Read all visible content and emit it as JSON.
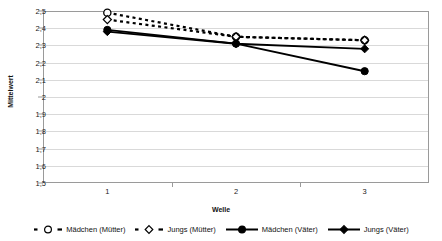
{
  "chart_data": {
    "type": "line",
    "title": "",
    "xlabel": "Welle",
    "ylabel": "Mittelwert",
    "categories": [
      "1",
      "2",
      "3"
    ],
    "ylim": [
      1.5,
      2.5
    ],
    "yticks": [
      "1,5",
      "1,6",
      "1,7",
      "1,8",
      "1,9",
      "2",
      "2,1",
      "2,2",
      "2,3",
      "2,4",
      "2,5"
    ],
    "ytick_values": [
      1.5,
      1.6,
      1.7,
      1.8,
      1.9,
      2.0,
      2.1,
      2.2,
      2.3,
      2.4,
      2.5
    ],
    "grid": true,
    "legend_position": "bottom",
    "series": [
      {
        "name": "Mädchen (Mütter)",
        "values": [
          2.49,
          2.35,
          2.33
        ],
        "line_style": "dashed",
        "marker": "open-circle",
        "color": "#000000"
      },
      {
        "name": "Jungs (Mütter)",
        "values": [
          2.45,
          2.35,
          2.33
        ],
        "line_style": "dashed",
        "marker": "open-diamond",
        "color": "#000000"
      },
      {
        "name": "Mädchen (Väter)",
        "values": [
          2.39,
          2.31,
          2.15
        ],
        "line_style": "solid",
        "marker": "filled-circle",
        "color": "#000000"
      },
      {
        "name": "Jungs (Väter)",
        "values": [
          2.38,
          2.31,
          2.28
        ],
        "line_style": "solid",
        "marker": "filled-diamond",
        "color": "#000000"
      }
    ]
  },
  "legend": {
    "items": [
      {
        "label": "Mädchen (Mütter)"
      },
      {
        "label": "Jungs (Mütter)"
      },
      {
        "label": "Mädchen (Väter)"
      },
      {
        "label": "Jungs (Väter)"
      }
    ]
  },
  "axes": {
    "y_title": "Mittelwert",
    "x_title": "Welle"
  },
  "colors": {
    "line": "#000000",
    "grid": "#d9d9d9",
    "frame": "#9a9a9a",
    "background": "#ffffff"
  }
}
